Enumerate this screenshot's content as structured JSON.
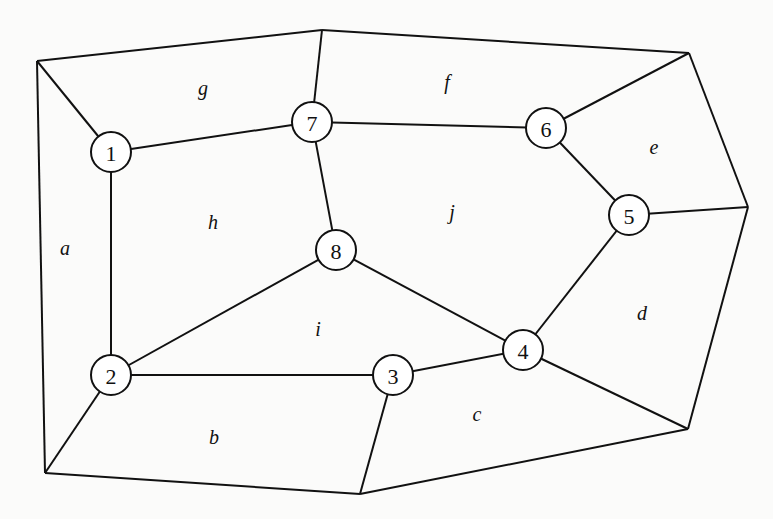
{
  "diagram": {
    "type": "planar-graph",
    "outer_vertices": [
      {
        "id": "o1",
        "x": 37,
        "y": 61
      },
      {
        "id": "o2",
        "x": 322,
        "y": 30
      },
      {
        "id": "o3",
        "x": 689,
        "y": 53
      },
      {
        "id": "o4",
        "x": 748,
        "y": 207
      },
      {
        "id": "o5",
        "x": 688,
        "y": 429
      },
      {
        "id": "o6",
        "x": 360,
        "y": 494
      },
      {
        "id": "o7",
        "x": 45,
        "y": 473
      }
    ],
    "nodes": [
      {
        "id": "1",
        "label": "1",
        "x": 111,
        "y": 152
      },
      {
        "id": "2",
        "label": "2",
        "x": 111,
        "y": 375
      },
      {
        "id": "3",
        "label": "3",
        "x": 393,
        "y": 375
      },
      {
        "id": "4",
        "label": "4",
        "x": 523,
        "y": 350
      },
      {
        "id": "5",
        "label": "5",
        "x": 629,
        "y": 215
      },
      {
        "id": "6",
        "label": "6",
        "x": 546,
        "y": 128
      },
      {
        "id": "7",
        "label": "7",
        "x": 312,
        "y": 122
      },
      {
        "id": "8",
        "label": "8",
        "x": 336,
        "y": 250
      }
    ],
    "edges": [
      [
        "o1",
        "o2"
      ],
      [
        "o2",
        "o3"
      ],
      [
        "o3",
        "o4"
      ],
      [
        "o4",
        "o5"
      ],
      [
        "o5",
        "o6"
      ],
      [
        "o6",
        "o7"
      ],
      [
        "o7",
        "o1"
      ],
      [
        "o1",
        "1"
      ],
      [
        "o2",
        "7"
      ],
      [
        "o3",
        "6"
      ],
      [
        "o4",
        "5"
      ],
      [
        "o5",
        "4"
      ],
      [
        "o6",
        "3"
      ],
      [
        "o7",
        "2"
      ],
      [
        "1",
        "7"
      ],
      [
        "1",
        "2"
      ],
      [
        "7",
        "6"
      ],
      [
        "7",
        "8"
      ],
      [
        "6",
        "5"
      ],
      [
        "5",
        "4"
      ],
      [
        "8",
        "2"
      ],
      [
        "8",
        "4"
      ],
      [
        "2",
        "3"
      ],
      [
        "3",
        "4"
      ]
    ],
    "node_radius": 20,
    "faces": [
      {
        "label": "a",
        "x": 65,
        "y": 248
      },
      {
        "label": "b",
        "x": 214,
        "y": 437
      },
      {
        "label": "c",
        "x": 477,
        "y": 414
      },
      {
        "label": "d",
        "x": 642,
        "y": 313
      },
      {
        "label": "e",
        "x": 654,
        "y": 147
      },
      {
        "label": "f",
        "x": 447,
        "y": 82
      },
      {
        "label": "g",
        "x": 203,
        "y": 88
      },
      {
        "label": "h",
        "x": 213,
        "y": 222
      },
      {
        "label": "i",
        "x": 318,
        "y": 329
      },
      {
        "label": "j",
        "x": 452,
        "y": 212
      }
    ]
  }
}
